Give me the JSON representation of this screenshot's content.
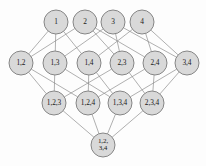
{
  "diagram": {
    "type": "lattice-hasse-diagram",
    "background_color": "#fdfdfd",
    "node_fill_color": "#d9d9d9",
    "node_stroke_color": "#7a7a7a",
    "edge_color": "#8e8e8e",
    "label_color": "#1a1a1a",
    "node_radius": 12,
    "levels": [
      {
        "level_index": 0,
        "name": "singletons",
        "y": 22,
        "nodes": [
          {
            "id": "n1",
            "label": "1",
            "lines": [
              "1"
            ],
            "cx": 56,
            "cy": 22
          },
          {
            "id": "n2",
            "label": "2",
            "lines": [
              "2"
            ],
            "cx": 85,
            "cy": 22
          },
          {
            "id": "n3",
            "label": "3",
            "lines": [
              "3"
            ],
            "cx": 113,
            "cy": 22
          },
          {
            "id": "n4",
            "label": "4",
            "lines": [
              "4"
            ],
            "cx": 142,
            "cy": 22
          }
        ]
      },
      {
        "level_index": 1,
        "name": "pairs",
        "y": 63,
        "nodes": [
          {
            "id": "n12",
            "label": "1,2",
            "lines": [
              "1,2"
            ],
            "cx": 21,
            "cy": 63
          },
          {
            "id": "n13",
            "label": "1,3",
            "lines": [
              "1,3"
            ],
            "cx": 55,
            "cy": 63
          },
          {
            "id": "n14",
            "label": "1,4",
            "lines": [
              "1,4"
            ],
            "cx": 89,
            "cy": 63
          },
          {
            "id": "n23",
            "label": "2,3",
            "lines": [
              "2,3"
            ],
            "cx": 122,
            "cy": 63
          },
          {
            "id": "n24",
            "label": "2,4",
            "lines": [
              "2,4"
            ],
            "cx": 155,
            "cy": 63
          },
          {
            "id": "n34",
            "label": "3,4",
            "lines": [
              "3,4"
            ],
            "cx": 187,
            "cy": 63
          }
        ]
      },
      {
        "level_index": 2,
        "name": "triples",
        "y": 103,
        "nodes": [
          {
            "id": "n123",
            "label": "1,2,3",
            "lines": [
              "1,2,3"
            ],
            "cx": 54,
            "cy": 103
          },
          {
            "id": "n124",
            "label": "1,2,4",
            "lines": [
              "1,2,4"
            ],
            "cx": 88,
            "cy": 103
          },
          {
            "id": "n134",
            "label": "1,3,4",
            "lines": [
              "1,3,4"
            ],
            "cx": 120,
            "cy": 103
          },
          {
            "id": "n234",
            "label": "2,3,4",
            "lines": [
              "2,3,4"
            ],
            "cx": 152,
            "cy": 103
          }
        ]
      },
      {
        "level_index": 3,
        "name": "full-set",
        "y": 145,
        "nodes": [
          {
            "id": "n1234",
            "label": "1,2, 3,4",
            "lines": [
              "1,2,",
              "3,4"
            ],
            "cx": 103,
            "cy": 145
          }
        ]
      }
    ],
    "edges": [
      {
        "from": "n1",
        "to": "n12"
      },
      {
        "from": "n1",
        "to": "n13"
      },
      {
        "from": "n1",
        "to": "n14"
      },
      {
        "from": "n2",
        "to": "n12"
      },
      {
        "from": "n2",
        "to": "n23"
      },
      {
        "from": "n2",
        "to": "n24"
      },
      {
        "from": "n3",
        "to": "n13"
      },
      {
        "from": "n3",
        "to": "n23"
      },
      {
        "from": "n3",
        "to": "n34"
      },
      {
        "from": "n4",
        "to": "n14"
      },
      {
        "from": "n4",
        "to": "n24"
      },
      {
        "from": "n4",
        "to": "n34"
      },
      {
        "from": "n12",
        "to": "n123"
      },
      {
        "from": "n12",
        "to": "n124"
      },
      {
        "from": "n13",
        "to": "n123"
      },
      {
        "from": "n13",
        "to": "n134"
      },
      {
        "from": "n14",
        "to": "n124"
      },
      {
        "from": "n14",
        "to": "n134"
      },
      {
        "from": "n23",
        "to": "n123"
      },
      {
        "from": "n23",
        "to": "n234"
      },
      {
        "from": "n24",
        "to": "n124"
      },
      {
        "from": "n24",
        "to": "n234"
      },
      {
        "from": "n34",
        "to": "n134"
      },
      {
        "from": "n34",
        "to": "n234"
      },
      {
        "from": "n123",
        "to": "n1234"
      },
      {
        "from": "n124",
        "to": "n1234"
      },
      {
        "from": "n134",
        "to": "n1234"
      },
      {
        "from": "n234",
        "to": "n1234"
      }
    ]
  }
}
